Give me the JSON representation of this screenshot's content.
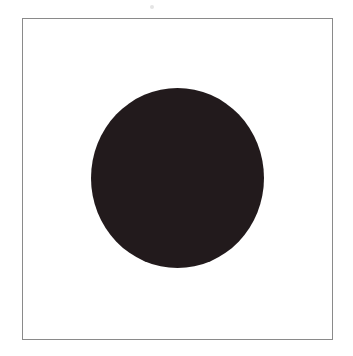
{
  "figure": {
    "shape": "circle",
    "fill_color": "#221a1c",
    "frame_border_color": "#8a8a8a",
    "background_color": "#ffffff"
  }
}
